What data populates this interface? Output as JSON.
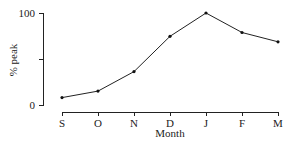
{
  "chart_data": {
    "type": "line",
    "title": "",
    "xlabel": "Month",
    "ylabel": "% peak",
    "categories": [
      "S",
      "O",
      "N",
      "D",
      "J",
      "F",
      "M"
    ],
    "values": [
      9,
      16,
      37,
      75,
      100,
      79,
      69
    ],
    "ylim": [
      0,
      100
    ],
    "yticks": [
      0,
      50,
      100
    ],
    "ytick_labels": [
      "0",
      "",
      "100"
    ],
    "grid": false,
    "legend": null,
    "marker": "dot"
  }
}
